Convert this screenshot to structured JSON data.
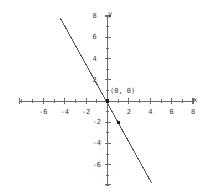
{
  "chart_data": {
    "type": "line",
    "title": "",
    "xlabel": "x",
    "ylabel": "y",
    "xlim": [
      -8.2,
      8.2
    ],
    "ylim": [
      -8.2,
      8.2
    ],
    "grid": false,
    "legend": "none",
    "x_ticks": [
      {
        "value": -6,
        "label": "-6"
      },
      {
        "value": -4,
        "label": "-4"
      },
      {
        "value": -2,
        "label": "-2"
      },
      {
        "value": 2,
        "label": "2"
      },
      {
        "value": 4,
        "label": "4"
      },
      {
        "value": 6,
        "label": "6"
      },
      {
        "value": 8,
        "label": "8"
      }
    ],
    "y_ticks": [
      {
        "value": 8,
        "label": "8"
      },
      {
        "value": 6,
        "label": "6"
      },
      {
        "value": 4,
        "label": "4"
      },
      {
        "value": 2,
        "label": "2"
      },
      {
        "value": -2,
        "label": "-2"
      },
      {
        "value": -4,
        "label": "-4"
      },
      {
        "value": -6,
        "label": "-6"
      }
    ],
    "minor_tick_interval": 1,
    "series": [
      {
        "name": "line",
        "type": "line",
        "slope": -2,
        "intercept": 0,
        "color": "#555555",
        "x_start": -4.4,
        "y_start": 7.8,
        "x_end": 4.1,
        "y_end": -7.7
      }
    ],
    "points": [
      {
        "x": 0,
        "y": 0,
        "label": "(0, 0)",
        "marker": "square",
        "color": "#1a1a1a"
      },
      {
        "x": 1,
        "y": -2,
        "label": "",
        "marker": "square",
        "color": "#1a1a1a"
      }
    ],
    "axis_color": "#6b6b6b",
    "background": "#ffffff"
  },
  "labels": {
    "x_axis_name": "x",
    "y_axis_name": "y",
    "origin_point_label": "(0, 0)"
  }
}
